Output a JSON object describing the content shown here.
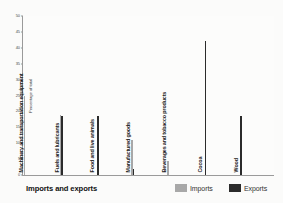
{
  "chart_data": {
    "type": "bar",
    "title": "",
    "xlabel": "Imports and exports",
    "ylabel": "Percentage of total",
    "ylim": [
      0,
      50
    ],
    "yticks": [
      "0",
      "5",
      "10",
      "15",
      "20",
      "25",
      "30",
      "35",
      "40",
      "45",
      "50"
    ],
    "grid": false,
    "legend_position": "bottom-right",
    "categories": [
      "Machinery and transportation equipment",
      "Fuels and lubricants",
      "Food and live animals",
      "Manufactured goods",
      "Beverages and tobacco products",
      "Cocoa",
      "Wood"
    ],
    "series": [
      {
        "name": "Imports",
        "color": "#a8a8a8",
        "values": [
          25,
          19,
          0,
          11,
          4.5,
          0,
          0
        ]
      },
      {
        "name": "Exports",
        "color": "#2b2b2b",
        "values": [
          0,
          18.5,
          18.5,
          2,
          0,
          42,
          18.5
        ]
      }
    ]
  },
  "legend": {
    "imports_label": "Imports",
    "exports_label": "Exports"
  }
}
